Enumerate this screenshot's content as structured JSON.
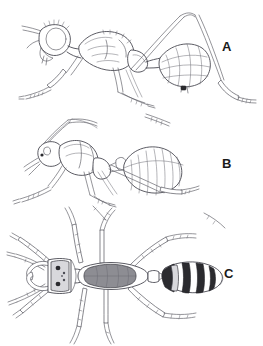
{
  "plate": {
    "background_color": "#ffffff",
    "line_color": "#4a4a52",
    "label_color": "#1a1a1a",
    "width": 263,
    "height": 346
  },
  "panels": [
    {
      "id": "a",
      "label": "A",
      "label_x": 222,
      "label_y": 40,
      "view": "lateral",
      "subject": "wasp-like-ant-mimic",
      "features": "reticulate-netted-gaster, large-compound-eye, long-legs"
    },
    {
      "id": "b",
      "label": "B",
      "label_x": 222,
      "label_y": 157,
      "view": "lateral",
      "subject": "ant-worker",
      "features": "striated-gaster, elbowed-antenna, petiole-node"
    },
    {
      "id": "c",
      "label": "C",
      "label_x": 224,
      "label_y": 267,
      "view": "dorsal",
      "subject": "ant-worker",
      "features": "banded-gaster, mandibles, six-legs, two-antennae"
    }
  ]
}
